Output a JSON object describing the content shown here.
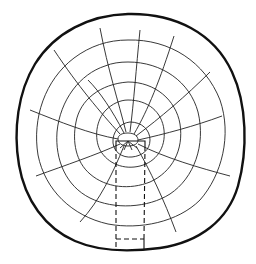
{
  "diagram": {
    "colors": {
      "background": "#ffffff",
      "ink": "#111111"
    },
    "center": [
      128,
      140
    ],
    "ring_count": 6,
    "ray_count": 14,
    "sample_strip": {
      "style": "dashed",
      "x": [
        116,
        145
      ],
      "y": [
        142,
        248
      ]
    }
  }
}
